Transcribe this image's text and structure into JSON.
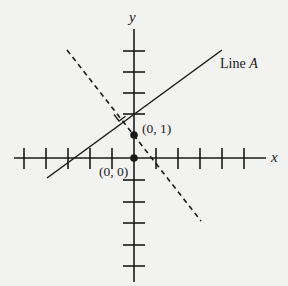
{
  "diagram": {
    "type": "coordinate-plane",
    "axes": {
      "x_label": "x",
      "y_label": "y",
      "x_ticks_left": 5,
      "x_ticks_right": 5,
      "y_ticks_up": 4,
      "y_ticks_down": 5
    },
    "points": [
      {
        "label": "(0, 1)",
        "x": 0,
        "y": 1
      },
      {
        "label": "(0, 0)",
        "x": 0,
        "y": 0
      }
    ],
    "lines": [
      {
        "name": "Line A",
        "style": "solid"
      },
      {
        "name": "perpendicular",
        "style": "dashed",
        "passes_through": "(0, 1)"
      }
    ],
    "line_a_label": {
      "prefix": "Line ",
      "name": "A"
    },
    "right_angle_marker": true,
    "colors": {
      "ink": "#1a1a1a",
      "background": "#f2f2f0"
    }
  }
}
